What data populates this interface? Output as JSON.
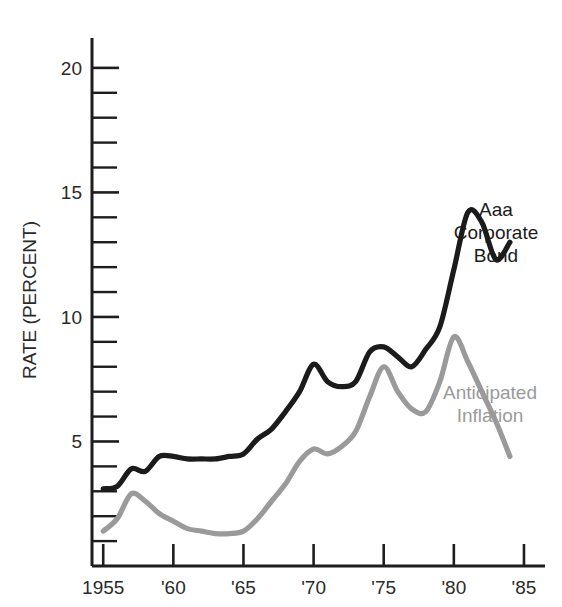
{
  "chart_data": {
    "type": "line",
    "title": "",
    "xlabel": "",
    "ylabel": "RATE (PERCENT)",
    "xlim": [
      1954.2,
      1986.5
    ],
    "ylim": [
      0,
      21.2
    ],
    "grid": false,
    "legend_position": "inline-right",
    "x_tick_labels": [
      "1955",
      "'60",
      "'65",
      "'70",
      "'75",
      "'80",
      "'85"
    ],
    "x_tick_values": [
      1955,
      1960,
      1965,
      1970,
      1975,
      1980,
      1985
    ],
    "y_tick_labels": [
      "5",
      "10",
      "15",
      "20"
    ],
    "y_tick_values": [
      5,
      10,
      15,
      20
    ],
    "y_minor_ticks": [
      1,
      2,
      3,
      4,
      6,
      7,
      8,
      9,
      11,
      12,
      13,
      14,
      16,
      17,
      18,
      19
    ],
    "series": [
      {
        "name": "Aaa Corporate Bond",
        "color": "#1b1b1b",
        "label_lines": [
          "Aaa",
          "Corporate",
          "Bond"
        ],
        "x": [
          1955,
          1956,
          1957,
          1958,
          1959,
          1960,
          1961,
          1962,
          1963,
          1964,
          1965,
          1966,
          1967,
          1968,
          1969,
          1970,
          1971,
          1972,
          1973,
          1974,
          1975,
          1976,
          1977,
          1978,
          1979,
          1980,
          1981,
          1982,
          1983,
          1984
        ],
        "values": [
          3.1,
          3.2,
          3.9,
          3.8,
          4.4,
          4.4,
          4.3,
          4.3,
          4.3,
          4.4,
          4.5,
          5.1,
          5.5,
          6.2,
          7.0,
          8.1,
          7.4,
          7.2,
          7.4,
          8.6,
          8.8,
          8.4,
          8.0,
          8.7,
          9.6,
          11.9,
          14.2,
          13.8,
          12.3,
          13.0
        ]
      },
      {
        "name": "Anticipated Inflation",
        "color": "#9a9a9a",
        "label_lines": [
          "Anticipated",
          "Inflation"
        ],
        "x": [
          1955,
          1956,
          1957,
          1958,
          1959,
          1960,
          1961,
          1962,
          1963,
          1964,
          1965,
          1966,
          1967,
          1968,
          1969,
          1970,
          1971,
          1972,
          1973,
          1974,
          1975,
          1976,
          1977,
          1978,
          1979,
          1980,
          1981,
          1982,
          1983,
          1984
        ],
        "values": [
          1.4,
          1.9,
          2.9,
          2.6,
          2.1,
          1.8,
          1.5,
          1.4,
          1.3,
          1.3,
          1.4,
          1.9,
          2.6,
          3.3,
          4.2,
          4.7,
          4.5,
          4.8,
          5.4,
          6.8,
          8.0,
          7.0,
          6.3,
          6.2,
          7.4,
          9.2,
          8.2,
          7.0,
          5.8,
          4.4
        ]
      }
    ]
  },
  "axis": {
    "y_title": "RATE (PERCENT)"
  }
}
